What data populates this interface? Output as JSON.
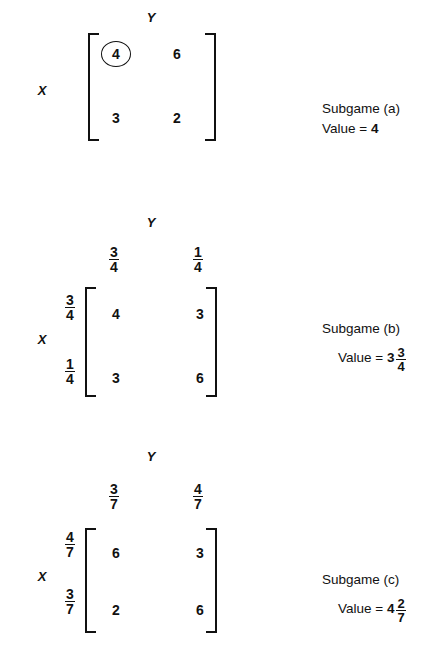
{
  "figure": {
    "subgames": [
      {
        "id": "a",
        "row_player_label": "X",
        "col_player_label": "Y",
        "col_headers": [],
        "row_headers": [],
        "matrix": [
          [
            "4",
            "6"
          ],
          [
            "3",
            "2"
          ]
        ],
        "circled_cell": {
          "row": 0,
          "col": 0
        },
        "caption_name": "Subgame (a)",
        "value_lead": "Value = ",
        "value_whole": "4",
        "value_frac_num": "",
        "value_frac_den": ""
      },
      {
        "id": "b",
        "row_player_label": "X",
        "col_player_label": "Y",
        "col_headers": [
          {
            "num": "3",
            "den": "4"
          },
          {
            "num": "1",
            "den": "4"
          }
        ],
        "row_headers": [
          {
            "num": "3",
            "den": "4"
          },
          {
            "num": "1",
            "den": "4"
          }
        ],
        "matrix": [
          [
            "4",
            "3"
          ],
          [
            "3",
            "6"
          ]
        ],
        "circled_cell": null,
        "caption_name": "Subgame (b)",
        "value_lead": "Value = ",
        "value_whole": "3",
        "value_frac_num": "3",
        "value_frac_den": "4"
      },
      {
        "id": "c",
        "row_player_label": "X",
        "col_player_label": "Y",
        "col_headers": [
          {
            "num": "3",
            "den": "7"
          },
          {
            "num": "4",
            "den": "7"
          }
        ],
        "row_headers": [
          {
            "num": "4",
            "den": "7"
          },
          {
            "num": "3",
            "den": "7"
          }
        ],
        "matrix": [
          [
            "6",
            "3"
          ],
          [
            "2",
            "6"
          ]
        ],
        "circled_cell": null,
        "caption_name": "Subgame (c)",
        "value_lead": "Value = ",
        "value_whole": "4",
        "value_frac_num": "2",
        "value_frac_den": "7"
      }
    ]
  }
}
